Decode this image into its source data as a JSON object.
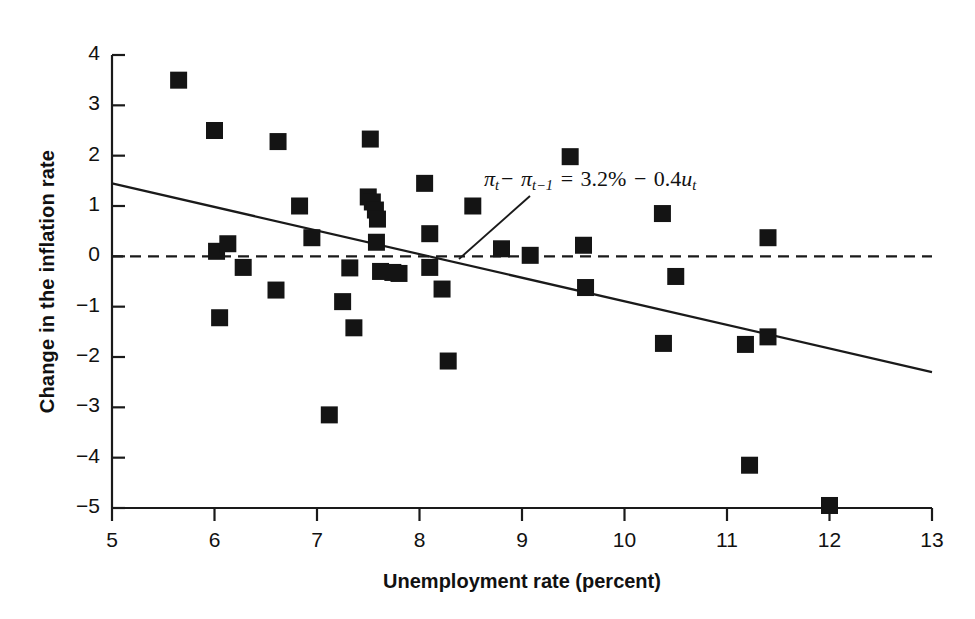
{
  "figure": {
    "background": "#ffffff",
    "ink_color": "#1a1a1a",
    "marker_color": "#141414"
  },
  "annotation": {
    "pi": "π",
    "t": "t",
    "t_minus_1": "t−1",
    "minus": "−",
    "equals": "=",
    "intercept": "3.2%",
    "slope_term": "0.4",
    "u": "u",
    "full_text": "πt − πt−1 = 3.2% − 0.4ut"
  },
  "chart_data": {
    "type": "scatter",
    "title": "",
    "xlabel": "Unemployment rate (percent)",
    "ylabel": "Change in the inflation rate",
    "xlim": [
      5,
      13
    ],
    "ylim": [
      -5,
      4
    ],
    "xticks": [
      5,
      6,
      7,
      8,
      9,
      10,
      11,
      12,
      13
    ],
    "yticks": [
      4,
      3,
      2,
      1,
      0,
      -1,
      -2,
      -3,
      -4,
      -5
    ],
    "xtick_labels": [
      "5",
      "6",
      "7",
      "8",
      "9",
      "10",
      "11",
      "12",
      "13"
    ],
    "ytick_labels": [
      "4",
      "3",
      "2",
      "1",
      "0",
      "−1",
      "−2",
      "−3",
      "−4",
      "−5"
    ],
    "grid": false,
    "legend": null,
    "zero_line": {
      "y": 0,
      "style": "dashed"
    },
    "fit_line": {
      "label": "πt − πt−1 = 3.2% − 0.4ut",
      "intercept": 3.2,
      "slope": -0.4,
      "x_start": 5,
      "y_start": 1.45,
      "x_end": 13,
      "y_end": -2.3
    },
    "points": [
      {
        "x": 5.65,
        "y": 3.5
      },
      {
        "x": 6.0,
        "y": 2.5
      },
      {
        "x": 6.02,
        "y": 0.1
      },
      {
        "x": 6.13,
        "y": 0.25
      },
      {
        "x": 6.05,
        "y": -1.22
      },
      {
        "x": 6.28,
        "y": -0.22
      },
      {
        "x": 6.62,
        "y": 2.28
      },
      {
        "x": 6.6,
        "y": -0.67
      },
      {
        "x": 6.83,
        "y": 1.0
      },
      {
        "x": 6.95,
        "y": 0.37
      },
      {
        "x": 7.12,
        "y": -3.15
      },
      {
        "x": 7.25,
        "y": -0.9
      },
      {
        "x": 7.32,
        "y": -0.23
      },
      {
        "x": 7.36,
        "y": -1.42
      },
      {
        "x": 7.5,
        "y": 1.18
      },
      {
        "x": 7.54,
        "y": 1.08
      },
      {
        "x": 7.57,
        "y": 0.92
      },
      {
        "x": 7.59,
        "y": 0.74
      },
      {
        "x": 7.58,
        "y": 0.28
      },
      {
        "x": 7.52,
        "y": 2.33
      },
      {
        "x": 7.62,
        "y": -0.3
      },
      {
        "x": 7.74,
        "y": -0.32
      },
      {
        "x": 7.8,
        "y": -0.34
      },
      {
        "x": 8.05,
        "y": 1.45
      },
      {
        "x": 8.1,
        "y": 0.45
      },
      {
        "x": 8.1,
        "y": -0.22
      },
      {
        "x": 8.22,
        "y": -0.65
      },
      {
        "x": 8.28,
        "y": -2.08
      },
      {
        "x": 8.52,
        "y": 1.0
      },
      {
        "x": 8.8,
        "y": 0.15
      },
      {
        "x": 9.08,
        "y": 0.02
      },
      {
        "x": 9.47,
        "y": 1.98
      },
      {
        "x": 9.6,
        "y": 0.22
      },
      {
        "x": 9.62,
        "y": -0.62
      },
      {
        "x": 10.37,
        "y": 0.85
      },
      {
        "x": 10.38,
        "y": -1.73
      },
      {
        "x": 10.5,
        "y": -0.4
      },
      {
        "x": 11.18,
        "y": -1.75
      },
      {
        "x": 11.22,
        "y": -4.15
      },
      {
        "x": 11.4,
        "y": 0.37
      },
      {
        "x": 11.4,
        "y": -1.6
      },
      {
        "x": 12.0,
        "y": -4.95
      }
    ]
  }
}
